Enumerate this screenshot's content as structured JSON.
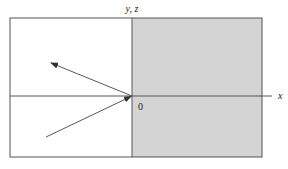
{
  "diagram": {
    "labels": {
      "vertical_axis": "y, z",
      "horizontal_axis": "x",
      "origin": "0"
    },
    "regions": {
      "left": {
        "description": "unshaded region (x < 0)",
        "fill": "#ffffff"
      },
      "right": {
        "description": "shaded region (x > 0)",
        "fill": "#d4d4d4"
      }
    },
    "colors": {
      "line": "#555555",
      "shade": "#d4d4d4",
      "text": "#222222"
    },
    "rays": [
      {
        "name": "incident-ray",
        "description": "ray from lower left travelling toward origin",
        "direction": "toward origin"
      },
      {
        "name": "reflected-ray",
        "description": "ray leaving origin toward upper left",
        "direction": "away from origin"
      }
    ]
  }
}
